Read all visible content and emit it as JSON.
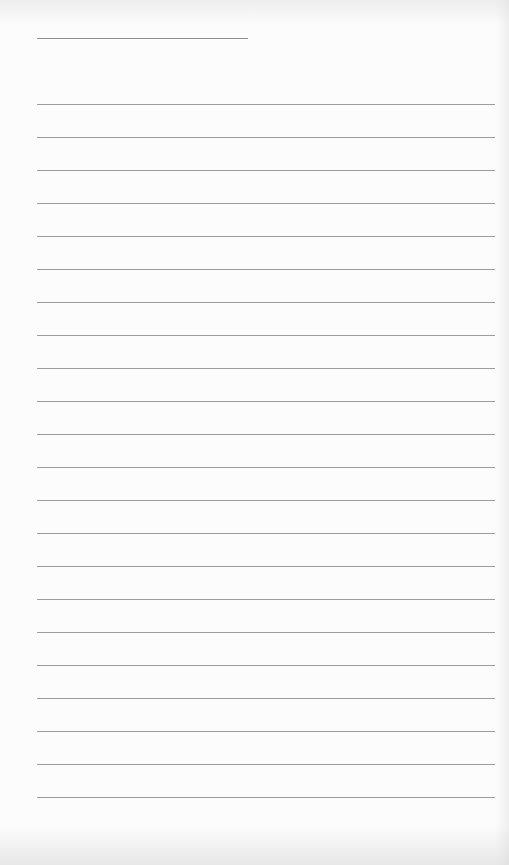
{
  "document": {
    "type": "lined-paper",
    "header_field": {
      "value": ""
    },
    "lines": [
      {
        "text": ""
      },
      {
        "text": ""
      },
      {
        "text": ""
      },
      {
        "text": ""
      },
      {
        "text": ""
      },
      {
        "text": ""
      },
      {
        "text": ""
      },
      {
        "text": ""
      },
      {
        "text": ""
      },
      {
        "text": ""
      },
      {
        "text": ""
      },
      {
        "text": ""
      },
      {
        "text": ""
      },
      {
        "text": ""
      },
      {
        "text": ""
      },
      {
        "text": ""
      },
      {
        "text": ""
      },
      {
        "text": ""
      },
      {
        "text": ""
      },
      {
        "text": ""
      },
      {
        "text": ""
      },
      {
        "text": ""
      }
    ],
    "colors": {
      "background": "#fcfcfc",
      "rule": "#9c9c9c"
    }
  }
}
